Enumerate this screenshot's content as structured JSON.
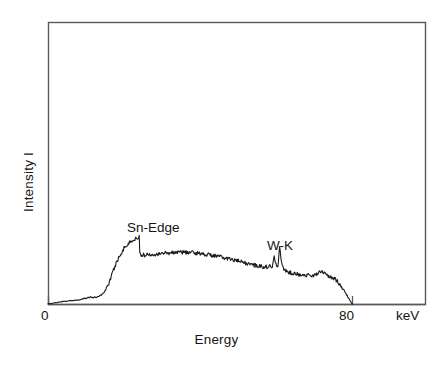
{
  "figure": {
    "background_color": "#ffffff",
    "line_color": "#1a1a1a",
    "frame_color": "#555555"
  },
  "axes": {
    "ylabel": "Intensity I",
    "xlabel": "Energy",
    "x_unit": "keV",
    "x_ticks": [
      {
        "label": "0",
        "value": 0
      },
      {
        "label": "80",
        "value": 80
      }
    ]
  },
  "annotations": [
    {
      "id": "sn-edge",
      "text": "Sn-Edge",
      "x_kev": 24,
      "note": "absorption edge label above sharp drop"
    },
    {
      "id": "w-k",
      "text": "W-K",
      "x_kev": 62,
      "note": "tungsten K characteristic lines label above doublet"
    }
  ],
  "chart_data": {
    "type": "line",
    "title": "",
    "subtitle": "",
    "xlabel": "Energy",
    "ylabel": "Intensity I",
    "x_unit": "keV",
    "xlim": [
      0,
      100
    ],
    "ylim": [
      0,
      1
    ],
    "grid": false,
    "legend": null,
    "axis_style": "box-frame-with-inner-baseline",
    "tick_labels_x": [
      "0",
      "80"
    ],
    "tick_labels_y": [],
    "annotations": [
      "Sn-Edge",
      "W-K"
    ],
    "series": [
      {
        "name": "X-ray bremsstrahlung spectrum",
        "x": [
          0,
          2,
          4,
          6,
          8,
          10,
          11,
          12,
          13,
          14,
          15,
          16,
          17,
          18,
          19,
          20,
          21,
          22,
          23,
          24,
          24.2,
          25,
          26,
          28,
          30,
          32,
          34,
          36,
          38,
          40,
          42,
          44,
          46,
          48,
          50,
          52,
          54,
          56,
          58,
          59,
          59.5,
          60,
          60.5,
          61,
          61.5,
          62,
          62.5,
          63,
          64,
          65,
          66,
          68,
          70,
          71,
          72,
          73,
          74,
          75,
          76,
          78,
          80,
          80.2
        ],
        "y": [
          0.0,
          0.01,
          0.02,
          0.025,
          0.03,
          0.045,
          0.055,
          0.05,
          0.055,
          0.07,
          0.1,
          0.16,
          0.24,
          0.32,
          0.38,
          0.43,
          0.46,
          0.485,
          0.5,
          0.52,
          0.38,
          0.375,
          0.38,
          0.385,
          0.39,
          0.395,
          0.4,
          0.398,
          0.395,
          0.39,
          0.38,
          0.37,
          0.358,
          0.345,
          0.33,
          0.315,
          0.3,
          0.29,
          0.285,
          0.29,
          0.38,
          0.3,
          0.29,
          0.44,
          0.3,
          0.27,
          0.255,
          0.25,
          0.24,
          0.235,
          0.23,
          0.22,
          0.215,
          0.24,
          0.26,
          0.225,
          0.21,
          0.2,
          0.18,
          0.1,
          0.0,
          0.0
        ],
        "description": "Continuum bremsstrahlung with a sharp Sn absorption edge drop near 24 keV, gentle maximum near 34 keV, tungsten K-alpha/K-beta emission doublet near 60-61 keV, a smaller feature near 72 keV, and a cut-off falling to zero at 80 keV.",
        "noise": "high-frequency counting noise superimposed on the smooth continuum"
      }
    ]
  },
  "plot_geometry": {
    "frame_left_px": 48,
    "frame_top_px": 22,
    "frame_right_px": 426,
    "frame_bottom_px": 305,
    "baseline_y_px": 304,
    "x0_px": 48,
    "x80_px": 352
  }
}
